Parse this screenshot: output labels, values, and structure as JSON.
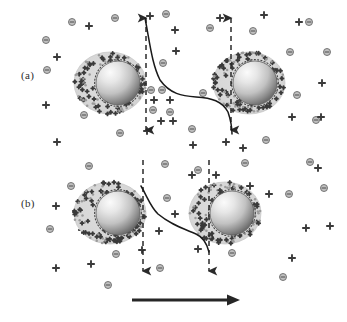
{
  "figure": {
    "width": 347,
    "height": 322,
    "background": "#ffffff",
    "type": "scientific-schematic"
  },
  "panels": [
    {
      "id": "a",
      "label": "(a)",
      "label_x": 21,
      "label_y": 69,
      "description": "large separation, double layers barely overlapping"
    },
    {
      "id": "b",
      "label": "(b)",
      "label_x": 21,
      "label_y": 197,
      "description": "small separation, double layers strongly overlapping"
    }
  ],
  "colors": {
    "halo_fill": "#d8d8d8",
    "halo_edge": "#bdbdbd",
    "core_light": "#f4f4f4",
    "core_mid": "#c9c9c9",
    "core_dark": "#6f6f6f",
    "core_edge": "#5a5a5a",
    "ion_negative_fill": "#bfbfbf",
    "ion_negative_stroke": "#6a6a6a",
    "ion_positive": "#3a3a3a",
    "curve": "#1a1a1a",
    "dashed_line": "#2a2a2a",
    "direction_arrow": "#262626",
    "label_text": "#2b2b2b"
  },
  "particles": {
    "a": [
      {
        "name": "particle-a-left",
        "cx": 110,
        "cy": 83,
        "halo_rx": 36,
        "halo_ry": 31,
        "core_cx": 118,
        "core_cy": 83,
        "core_r": 22
      },
      {
        "name": "particle-a-right",
        "cx": 249,
        "cy": 83,
        "halo_rx": 36,
        "halo_ry": 31,
        "core_cx": 255,
        "core_cy": 83,
        "core_r": 22
      }
    ],
    "b": [
      {
        "name": "particle-b-left",
        "cx": 110,
        "cy": 213,
        "halo_rx": 36,
        "halo_ry": 31,
        "core_cx": 118,
        "core_cy": 213,
        "core_r": 22
      },
      {
        "name": "particle-b-right",
        "cx": 225,
        "cy": 213,
        "halo_rx": 36,
        "halo_ry": 31,
        "core_cx": 232,
        "core_cy": 213,
        "core_r": 22
      }
    ]
  },
  "dashed_lines": {
    "a": [
      {
        "name": "dashed-line-a-left",
        "x": 146,
        "y1": 14,
        "y2": 134,
        "arrow_top": true,
        "arrow_bottom": true
      },
      {
        "name": "dashed-line-a-right",
        "x": 231,
        "y1": 14,
        "y2": 134,
        "arrow_top": true,
        "arrow_bottom": true
      }
    ],
    "b": [
      {
        "name": "dashed-line-b-left",
        "x": 143,
        "y1": 160,
        "y2": 275,
        "arrow_top": false,
        "arrow_bottom": true
      },
      {
        "name": "dashed-line-b-right",
        "x": 209,
        "y1": 160,
        "y2": 275,
        "arrow_top": false,
        "arrow_bottom": true
      }
    ]
  },
  "potential_curves": {
    "a": "M145,18 C150,44 152,64 160,80 C170,94 182,96 196,97 C212,98 222,101 228,112 C231,121 232,129 232,134",
    "b": "M141,186 C148,198 150,206 158,214 C170,224 182,228 196,234 C203,237 207,244 209,252"
  },
  "direction_arrow": {
    "name": "approach-direction-arrow",
    "x1": 132,
    "x2": 240,
    "y": 300,
    "thickness": 3.2,
    "head_length": 13,
    "head_width": 11
  },
  "chart_data": {
    "type": "line",
    "title": "",
    "xlabel": "",
    "ylabel": "",
    "series": [
      {
        "name": "potential-profile-large-separation",
        "panel": "a",
        "description": "surface potential decays steeply from each particle surface and flattens to a low value in the bulk between particles"
      },
      {
        "name": "potential-profile-small-separation",
        "panel": "b",
        "description": "overlapping double layers keep the mid-plane potential elevated; curve does not reach the bulk value"
      }
    ]
  },
  "ions": {
    "legend": {
      "negative_symbol": "−",
      "positive_symbol": "+",
      "negative_name": "negative-ion",
      "positive_name": "positive-ion"
    },
    "a_negative": [
      [
        72,
        22
      ],
      [
        115,
        18
      ],
      [
        166,
        14
      ],
      [
        210,
        28
      ],
      [
        309,
        22
      ],
      [
        46,
        40
      ],
      [
        163,
        63
      ],
      [
        253,
        31
      ],
      [
        290,
        52
      ],
      [
        327,
        52
      ],
      [
        151,
        90
      ],
      [
        162,
        90
      ],
      [
        203,
        93
      ],
      [
        153,
        110
      ],
      [
        170,
        112
      ],
      [
        84,
        115
      ],
      [
        120,
        133
      ],
      [
        266,
        140
      ],
      [
        47,
        70
      ],
      [
        297,
        95
      ],
      [
        316,
        120
      ],
      [
        192,
        129
      ]
    ],
    "a_positive": [
      [
        89,
        26
      ],
      [
        150,
        16
      ],
      [
        175,
        30
      ],
      [
        264,
        15
      ],
      [
        322,
        83
      ],
      [
        57,
        57
      ],
      [
        176,
        51
      ],
      [
        220,
        18
      ],
      [
        292,
        117
      ],
      [
        321,
        117
      ],
      [
        154,
        100
      ],
      [
        170,
        100
      ],
      [
        161,
        121
      ],
      [
        173,
        121
      ],
      [
        147,
        131
      ],
      [
        84,
        87
      ],
      [
        46,
        105
      ],
      [
        57,
        142
      ],
      [
        193,
        145
      ],
      [
        226,
        142
      ],
      [
        243,
        148
      ],
      [
        299,
        22
      ]
    ],
    "b_negative": [
      [
        89,
        166
      ],
      [
        165,
        164
      ],
      [
        198,
        170
      ],
      [
        245,
        163
      ],
      [
        310,
        162
      ],
      [
        71,
        186
      ],
      [
        167,
        198
      ],
      [
        289,
        194
      ],
      [
        324,
        188
      ],
      [
        232,
        253
      ],
      [
        116,
        254
      ],
      [
        160,
        268
      ],
      [
        108,
        285
      ],
      [
        252,
        222
      ],
      [
        283,
        277
      ],
      [
        50,
        229
      ]
    ],
    "b_positive": [
      [
        192,
        175
      ],
      [
        216,
        175
      ],
      [
        250,
        186
      ],
      [
        269,
        194
      ],
      [
        306,
        228
      ],
      [
        56,
        206
      ],
      [
        82,
        230
      ],
      [
        175,
        214
      ],
      [
        159,
        231
      ],
      [
        198,
        249
      ],
      [
        56,
        268
      ],
      [
        142,
        250
      ],
      [
        292,
        258
      ],
      [
        330,
        226
      ],
      [
        318,
        168
      ],
      [
        91,
        264
      ]
    ]
  }
}
